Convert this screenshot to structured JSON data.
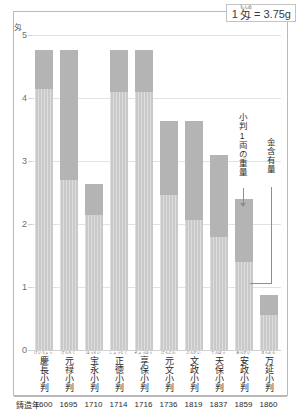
{
  "legend": {
    "number": "1",
    "unit": "匁",
    "unit_ruby": "もんめ",
    "equals": "= 3.75g"
  },
  "annotations": {
    "total_weight": "小判1両の重量",
    "gold_content": "金含有量"
  },
  "axis": {
    "y_unit": "匁",
    "year_row_label": "鋳造年"
  },
  "chart_data": {
    "type": "bar",
    "title": "",
    "xlabel": "鋳造年",
    "ylabel": "匁",
    "ylim": [
      0,
      5
    ],
    "yticks": [
      "0",
      "1",
      "2",
      "3",
      "4",
      "5"
    ],
    "grid": true,
    "legend_position": "annotated-arrows",
    "categories": [
      "慶長小判",
      "元禄小判",
      "宝永小判",
      "正徳小判",
      "享保小判",
      "文小判",
      "文政小判",
      "天保小判",
      "安政小判",
      "万延小判"
    ],
    "categories_full": [
      "慶長小判",
      "元禄小判",
      "宝永小判",
      "正徳小判",
      "享保小判",
      "元文小判",
      "文政小判",
      "天保小判",
      "安政小判",
      "万延小判"
    ],
    "categories_ruby": [
      "けいちょう",
      "げんろく",
      "ほうえい",
      "しょうとく",
      "きょうほう",
      "げんぶん",
      "ぶんせい",
      "てんぽう",
      "あんせい",
      "まんえん"
    ],
    "years": [
      "1600",
      "1695",
      "1710",
      "1714",
      "1716",
      "1736",
      "1819",
      "1837",
      "1859",
      "1860"
    ],
    "series": [
      {
        "name": "小判1両の重量",
        "color": "#b4b4b4",
        "values": [
          4.76,
          4.76,
          2.64,
          4.76,
          4.76,
          3.63,
          3.63,
          3.1,
          2.4,
          0.88
        ]
      },
      {
        "name": "金含有量",
        "color": "#c9c9c9",
        "values": [
          4.15,
          2.7,
          2.14,
          4.1,
          4.1,
          2.46,
          2.06,
          1.8,
          1.4,
          0.56
        ]
      }
    ]
  }
}
